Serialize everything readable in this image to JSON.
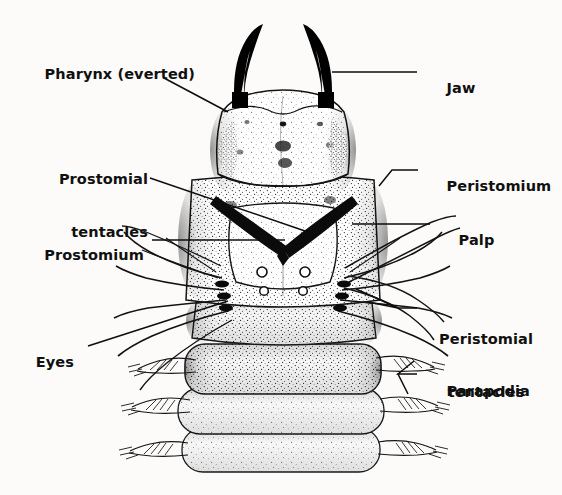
{
  "figure": {
    "view": "dorsal",
    "background_color": "#fcfbfa",
    "ink_color": "#101010",
    "jaw_color": "#000000"
  },
  "labels": [
    {
      "id": "pharynx",
      "text": "Pharynx (everted)",
      "side": "left",
      "lines": [
        "Pharynx (everted)"
      ],
      "x": 36,
      "y": 52,
      "leader": "M 164,78 L 228,112"
    },
    {
      "id": "prostomial-tentacles",
      "text": "Prostomial tentacles",
      "side": "left",
      "lines": [
        "Prostomial",
        "tentacles"
      ],
      "x": 37,
      "y": 139,
      "leader": "M 150,178 L 305,231"
    },
    {
      "id": "prostomium",
      "text": "Prostomium",
      "side": "left",
      "lines": [
        "Prostomium"
      ],
      "x": 33,
      "y": 229,
      "leader": "M 152,240 L 285,240"
    },
    {
      "id": "eyes",
      "text": "Eyes",
      "side": "left",
      "lines": [
        "Eyes"
      ],
      "x": 34,
      "y": 336,
      "leader": "M 88,346 L 228,301"
    },
    {
      "id": "jaw",
      "text": "Jaw",
      "side": "right",
      "lines": [
        "Jaw"
      ],
      "x": 425,
      "y": 61,
      "leader": "M 417,72 L 332,72"
    },
    {
      "id": "peristomium",
      "text": "Peristomium",
      "side": "right",
      "lines": [
        "Peristomium"
      ],
      "x": 425,
      "y": 160,
      "leader": "M 418,170 L 392,170 L 379,185"
    },
    {
      "id": "palp",
      "text": "Palp",
      "side": "right",
      "lines": [
        "Palp"
      ],
      "x": 438,
      "y": 213,
      "leader": "M 430,224 L 352,224"
    },
    {
      "id": "peristomial-tentacles",
      "text": "Peristomial tentacles",
      "side": "right",
      "lines": [
        "Peristomial",
        "tentacles"
      ],
      "x": 424,
      "y": 296,
      "leader": "M 417,305 L 398,305 L 355,288 M 417,318 L 399,318 L 366,300"
    },
    {
      "id": "parapodia",
      "text": "Parapodia",
      "side": "right",
      "lines": [
        "Parapodia"
      ],
      "x": 424,
      "y": 364,
      "leader": "M 417,374 L 398,374 L 412,363 M 417,374 L 398,374 L 409,392"
    }
  ],
  "anatomy": {
    "jaw_count": 2,
    "eye_count": 4,
    "visible_segments": 4,
    "prostomial_tentacle_count": 2,
    "palp_count": 2,
    "peristomial_tentacle_groups": 2,
    "parapodia_per_side": 4
  }
}
